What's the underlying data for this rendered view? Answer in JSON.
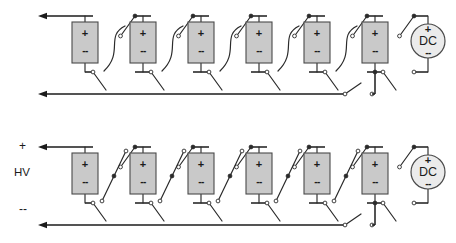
{
  "diagram": {
    "title_visible": false,
    "canvas": {
      "width": 456,
      "height": 243
    },
    "colors": {
      "wire": "#2b2b2b",
      "rail": "#1b1b1b",
      "cell_fill": "#c9c9c9",
      "cell_stroke": "#4a4a4a",
      "source_fill": "#ebebeb",
      "node_open_fill": "#ffffff",
      "node_closed_fill": "#2b2b2b",
      "background": "#ffffff"
    },
    "glyphs": {
      "plus": "+",
      "minus": "--",
      "dc_label": "DC"
    },
    "circuits": [
      {
        "id": "top-circuit",
        "name": "parallel-configuration",
        "switch_state": "parallel",
        "series_switches_closed": false,
        "rail_switches_closed": false,
        "cell_count": 6,
        "source": {
          "label": "DC",
          "plus": "+",
          "minus": "--"
        },
        "cells": [
          {
            "index": 1,
            "plus": "+",
            "minus": "--"
          },
          {
            "index": 2,
            "plus": "+",
            "minus": "--"
          },
          {
            "index": 3,
            "plus": "+",
            "minus": "--"
          },
          {
            "index": 4,
            "plus": "+",
            "minus": "--"
          },
          {
            "index": 5,
            "plus": "+",
            "minus": "--"
          },
          {
            "index": 6,
            "plus": "+",
            "minus": "--"
          }
        ],
        "terminal_labels": {
          "positive": "",
          "negative": "",
          "output": ""
        },
        "output_arrows": 2
      },
      {
        "id": "bottom-circuit",
        "name": "series-configuration",
        "switch_state": "series",
        "series_switches_closed": true,
        "rail_switches_closed": false,
        "cell_count": 6,
        "source": {
          "label": "DC",
          "plus": "+",
          "minus": "--"
        },
        "cells": [
          {
            "index": 1,
            "plus": "+",
            "minus": "--"
          },
          {
            "index": 2,
            "plus": "+",
            "minus": "--"
          },
          {
            "index": 3,
            "plus": "+",
            "minus": "--"
          },
          {
            "index": 4,
            "plus": "+",
            "minus": "--"
          },
          {
            "index": 5,
            "plus": "+",
            "minus": "--"
          },
          {
            "index": 6,
            "plus": "+",
            "minus": "--"
          }
        ],
        "terminal_labels": {
          "positive": "+",
          "negative": "--",
          "output": "HV"
        },
        "output_arrows": 2
      }
    ]
  }
}
